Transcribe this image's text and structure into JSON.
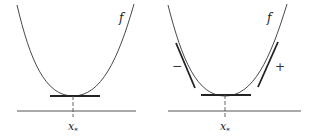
{
  "left_panel": {
    "curve_label": "f",
    "point_label": "x",
    "point_subscript": "*"
  },
  "right_panel": {
    "curve_label": "f",
    "point_label": "x",
    "point_subscript": "*",
    "left_sign": "−",
    "right_sign": "+"
  },
  "colors": {
    "curve": "#333333",
    "tangent": "#222222",
    "axis": "#555555"
  }
}
